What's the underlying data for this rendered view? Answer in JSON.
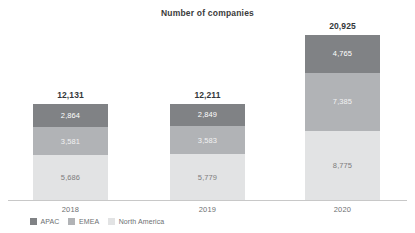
{
  "chart_data": {
    "type": "bar",
    "subtype": "stacked-bar",
    "title": "Number of companies",
    "xlabel": "",
    "ylabel": "",
    "categories": [
      "2018",
      "2019",
      "2020"
    ],
    "grid": false,
    "legend_position": "bottom-left",
    "axis_baseline_only": true,
    "ylim": [
      0,
      20925
    ],
    "stack_order_bottom_to_top": [
      "North America",
      "EMEA",
      "APAC"
    ],
    "series": [
      {
        "name": "APAC",
        "color": "#808285",
        "values": [
          2864,
          2849,
          4765
        ]
      },
      {
        "name": "EMEA",
        "color": "#b1b3b6",
        "values": [
          3581,
          3583,
          7385
        ]
      },
      {
        "name": "North America",
        "color": "#e2e3e4",
        "values": [
          5686,
          5779,
          8775
        ]
      }
    ],
    "totals": [
      12131,
      12211,
      20925
    ],
    "totals_formatted": [
      "12,131",
      "12,211",
      "20,925"
    ],
    "labels_formatted": {
      "APAC": [
        "2,864",
        "2,849",
        "4,765"
      ],
      "EMEA": [
        "3,581",
        "3,583",
        "7,385"
      ],
      "North America": [
        "5,686",
        "5,779",
        "8,775"
      ]
    }
  },
  "legend": {
    "items": [
      {
        "label": "APAC",
        "color": "#808285"
      },
      {
        "label": "EMEA",
        "color": "#b1b3b6"
      },
      {
        "label": "North America",
        "color": "#e2e3e4"
      }
    ]
  },
  "colors": {
    "background": "#ffffff",
    "axis": "#c8c8c8",
    "title_text": "#3b3b3b",
    "total_text": "#33373a",
    "tick_text": "#6d7072"
  }
}
